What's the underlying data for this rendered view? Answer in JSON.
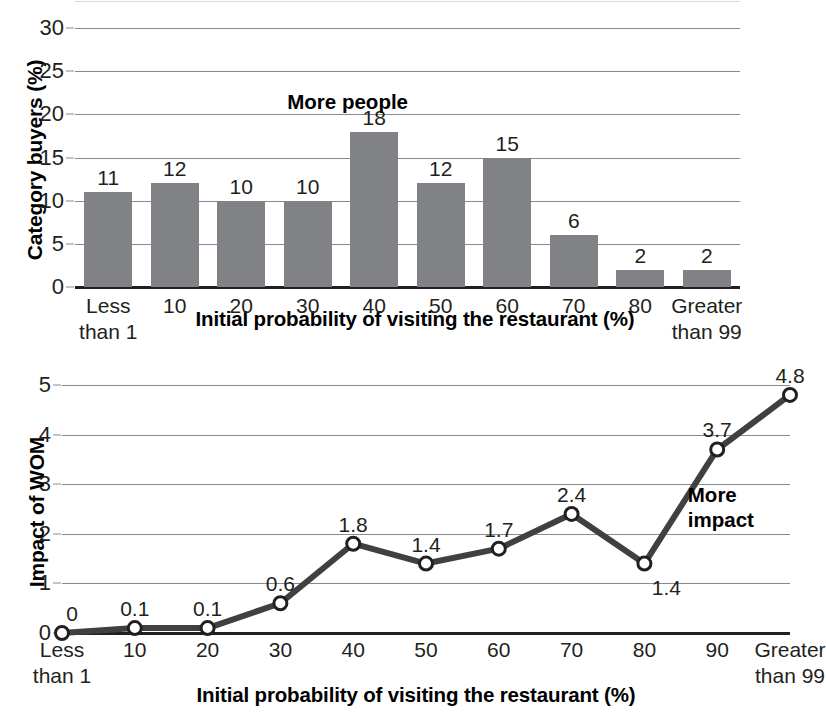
{
  "chart_data": [
    {
      "type": "bar",
      "id": "category-buyers",
      "title": "",
      "xlabel": "Initial probability of visiting the restaurant (%)",
      "ylabel": "Category buyers (%)",
      "categories": [
        "Less\nthan 1",
        "10",
        "20",
        "30",
        "40",
        "50",
        "60",
        "70",
        "80",
        "Greater\nthan 99"
      ],
      "category_lines": [
        [
          "Less",
          "than 1"
        ],
        [
          "10"
        ],
        [
          "20"
        ],
        [
          "30"
        ],
        [
          "40"
        ],
        [
          "50"
        ],
        [
          "60"
        ],
        [
          "70"
        ],
        [
          "80"
        ],
        [
          "Greater",
          "than 99"
        ]
      ],
      "values": [
        11,
        12,
        10,
        10,
        18,
        12,
        15,
        6,
        2,
        2
      ],
      "ylim": [
        0,
        30
      ],
      "yticks": [
        0,
        5,
        10,
        15,
        20,
        25,
        30
      ],
      "ytick_labels": [
        "0",
        "5",
        "10",
        "15",
        "20",
        "25",
        "30"
      ],
      "grid": true,
      "legend": "none",
      "bar_color": "#808285",
      "annotations": [
        {
          "text": "More people",
          "x_value": 3.6,
          "y_value": 21.5
        }
      ]
    },
    {
      "type": "line",
      "id": "impact-of-wom",
      "title": "",
      "xlabel": "Initial probability of visiting the restaurant (%)",
      "ylabel": "Impact of WOM",
      "categories": [
        "Less\nthan 1",
        "10",
        "20",
        "30",
        "40",
        "50",
        "60",
        "70",
        "80",
        "90",
        "Greater\nthan 99"
      ],
      "category_lines": [
        [
          "Less",
          "than 1"
        ],
        [
          "10"
        ],
        [
          "20"
        ],
        [
          "30"
        ],
        [
          "40"
        ],
        [
          "50"
        ],
        [
          "60"
        ],
        [
          "70"
        ],
        [
          "80"
        ],
        [
          "90"
        ],
        [
          "Greater",
          "than 99"
        ]
      ],
      "values": [
        0,
        0.1,
        0.1,
        0.6,
        1.8,
        1.4,
        1.7,
        2.4,
        1.4,
        3.7,
        4.8
      ],
      "value_labels": [
        "0",
        "0.1",
        "0.1",
        "0.6",
        "1.8",
        "1.4",
        "1.7",
        "2.4",
        "1.4",
        "3.7",
        "4.8"
      ],
      "label_below": [
        false,
        false,
        false,
        false,
        false,
        false,
        false,
        false,
        true,
        false,
        false
      ],
      "ylim": [
        0,
        5
      ],
      "yticks": [
        0,
        1,
        2,
        3,
        4,
        5
      ],
      "ytick_labels": [
        "0",
        "1",
        "2",
        "3",
        "4",
        "5"
      ],
      "grid": true,
      "legend": "none",
      "line_color": "#404040",
      "marker_face": "#ffffff",
      "marker_edge": "#231f20",
      "annotations": [
        {
          "text_lines": [
            "More",
            "impact"
          ],
          "x_value": 9.05,
          "y_value": 2.55
        }
      ]
    }
  ]
}
